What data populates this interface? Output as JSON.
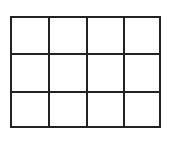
{
  "diagram": {
    "type": "grid",
    "rows": 3,
    "columns": 4,
    "line_color": "#222222",
    "background": "#ffffff"
  }
}
